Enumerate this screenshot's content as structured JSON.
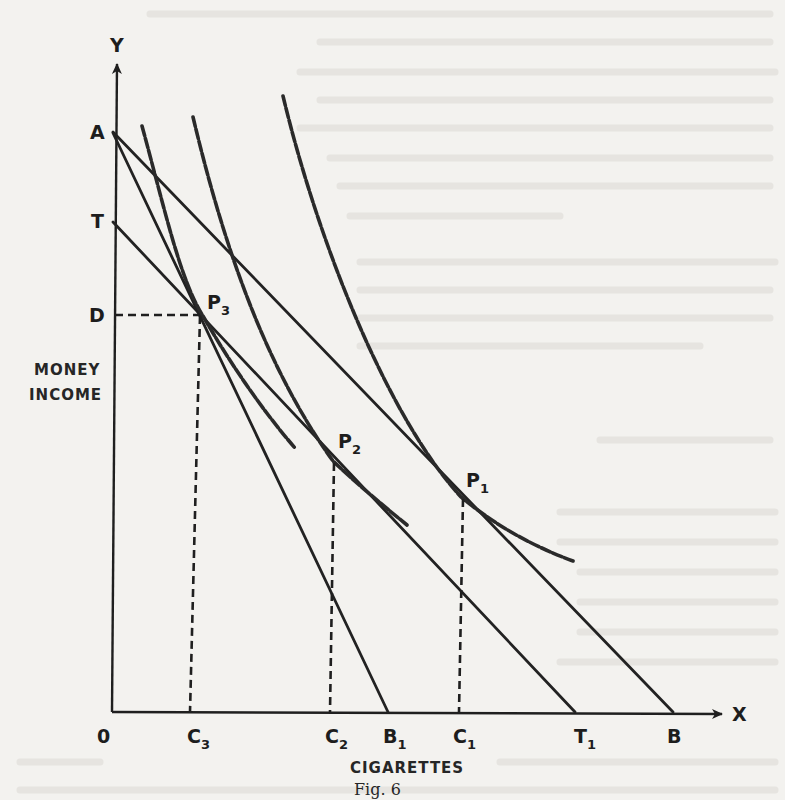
{
  "figure": {
    "caption": "Fig. 6",
    "axes": {
      "y_label": "Y",
      "x_label": "X",
      "origin_label": "0",
      "y_title_line1": "MONEY",
      "y_title_line2": "INCOME",
      "x_title": "CIGARETTES"
    },
    "y_points": {
      "A": "A",
      "T": "T",
      "D": "D"
    },
    "x_points": {
      "C3_main": "C",
      "C3_sub": "3",
      "C2_main": "C",
      "C2_sub": "2",
      "B1_main": "B",
      "B1_sub": "1",
      "C1_main": "C",
      "C1_sub": "1",
      "T1_main": "T",
      "T1_sub": "1",
      "B": "B"
    },
    "tangency_points": {
      "P3_main": "P",
      "P3_sub": "3",
      "P2_main": "P",
      "P2_sub": "2",
      "P1_main": "P",
      "P1_sub": "1"
    },
    "budget_lines": [
      {
        "name": "AB",
        "from": "A",
        "to": "B"
      },
      {
        "name": "AB1",
        "from": "A",
        "to": "B1"
      },
      {
        "name": "TT1",
        "from": "T",
        "to": "T1"
      }
    ],
    "indifference_curves": [
      {
        "name": "curve-through-P3",
        "style": "dashed"
      },
      {
        "name": "curve-through-P2",
        "style": "dashed"
      },
      {
        "name": "curve-through-P1",
        "style": "dashed"
      }
    ],
    "guides": [
      {
        "name": "D-to-P3",
        "style": "dashed"
      },
      {
        "name": "P3-to-C3",
        "style": "dashed"
      },
      {
        "name": "P2-to-C2",
        "style": "dashed"
      },
      {
        "name": "P1-to-C1",
        "style": "dashed"
      }
    ],
    "colors": {
      "ink": "#1f1f1f",
      "paper": "#f3f2ef",
      "bleed": "#e2e0dc"
    }
  }
}
